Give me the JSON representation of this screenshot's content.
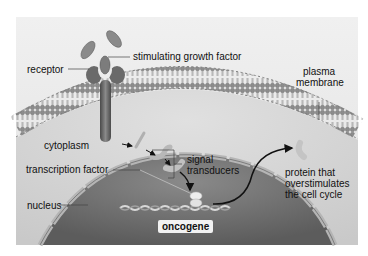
{
  "diagram": {
    "labels": {
      "stimulating_growth_factor": "stimulating growth factor",
      "receptor": "receptor",
      "plasma_membrane_line1": "plasma",
      "plasma_membrane_line2": "membrane",
      "cytoplasm": "cytoplasm",
      "signal_transducers_line1": "signal",
      "signal_transducers_line2": "transducers",
      "transcription_factor": "transcription factor",
      "nucleus": "nucleus",
      "oncogene": "oncogene",
      "protein_line1": "protein that",
      "protein_line2": "overstimulates",
      "protein_line3": "the cell cycle"
    },
    "colors": {
      "background": "#ffffff",
      "cytoplasm": "#d9d9d9",
      "outer_bg": "#ececec",
      "membrane_head": "#8a8a8a",
      "receptor": "#6e6e6e",
      "nucleus": "#7a7a7a",
      "arrow": "#111111"
    }
  }
}
